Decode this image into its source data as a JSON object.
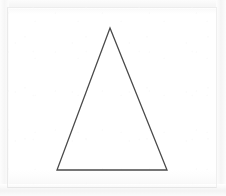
{
  "figure": {
    "shape_name": "triangle",
    "background_color": "#ffffff",
    "stroke_color": "#4a4a4a",
    "stroke_width": 1.3,
    "fill_color": "none",
    "canvas": {
      "width": 226,
      "height": 196
    },
    "vertices": [
      {
        "label": "apex",
        "x": 110,
        "y": 28
      },
      {
        "label": "bottom-right",
        "x": 167,
        "y": 170
      },
      {
        "label": "bottom-left",
        "x": 57,
        "y": 170
      }
    ],
    "points_attr": "110,28 167,170 57,170",
    "frame": {
      "color": "#ededed",
      "inset_left": 7,
      "inset_top": 7,
      "width": 210,
      "height": 181
    }
  }
}
